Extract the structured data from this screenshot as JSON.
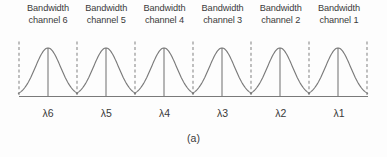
{
  "figure": {
    "caption": "(a)",
    "channels": [
      {
        "label_line1": "Bandwidth",
        "label_line2": "channel 6",
        "wavelength": "λ6"
      },
      {
        "label_line1": "Bandwidth",
        "label_line2": "channel 5",
        "wavelength": "λ5"
      },
      {
        "label_line1": "Bandwidth",
        "label_line2": "channel 4",
        "wavelength": "λ4"
      },
      {
        "label_line1": "Bandwidth",
        "label_line2": "channel 3",
        "wavelength": "λ3"
      },
      {
        "label_line1": "Bandwidth",
        "label_line2": "channel 2",
        "wavelength": "λ2"
      },
      {
        "label_line1": "Bandwidth",
        "label_line2": "channel 1",
        "wavelength": "λ1"
      }
    ],
    "colors": {
      "line": "#7a7a7a",
      "dashed": "#8c8c8c",
      "text": "#3a3a3a",
      "background": "#fdfdfd"
    }
  },
  "chart_data": {
    "type": "line",
    "title": "",
    "xlabel": "",
    "ylabel": "",
    "categories": [
      "λ6",
      "λ5",
      "λ4",
      "λ3",
      "λ2",
      "λ1"
    ],
    "values": [
      1,
      1,
      1,
      1,
      1,
      1
    ],
    "peak_positions": [
      48,
      106,
      164,
      222,
      280,
      338
    ],
    "boundary_positions": [
      19,
      77,
      135,
      193,
      251,
      309,
      367
    ],
    "ylim": [
      0,
      1
    ],
    "grid": false,
    "legend": "none"
  }
}
